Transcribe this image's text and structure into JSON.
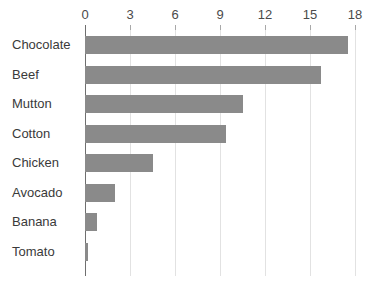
{
  "chart_data": {
    "type": "bar",
    "orientation": "horizontal",
    "title": "",
    "subtitle": "",
    "xlabel": "",
    "ylabel": "",
    "categories": [
      "Chocolate",
      "Beef",
      "Mutton",
      "Cotton",
      "Chicken",
      "Avocado",
      "Banana",
      "Tomato"
    ],
    "values": [
      17.5,
      15.7,
      10.5,
      9.4,
      4.5,
      2.0,
      0.8,
      0.2
    ],
    "series": [
      {
        "name": "",
        "values": [
          17.5,
          15.7,
          10.5,
          9.4,
          4.5,
          2.0,
          0.8,
          0.2
        ]
      }
    ],
    "xlim": [
      0,
      18
    ],
    "xticks": [
      0,
      3,
      6,
      9,
      12,
      15,
      18
    ],
    "xtick_labels": [
      "0",
      "3",
      "6",
      "9",
      "12",
      "15",
      "18"
    ],
    "grid": true,
    "grid_axis": "x",
    "legend": false,
    "legend_position": "none",
    "bar_color": "#8a8a8a",
    "gridline_color": "#e2e2e2",
    "axis_color": "#6f6f6f",
    "background_color": "#ffffff",
    "text_color": "#3a3a3a",
    "annotations": []
  }
}
